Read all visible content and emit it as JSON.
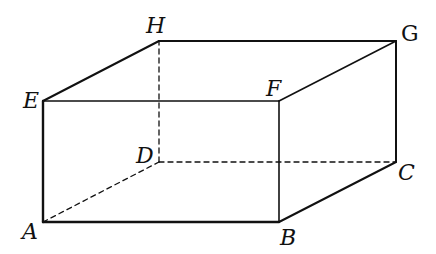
{
  "diagram": {
    "type": "rectangular-prism",
    "colors": {
      "stroke": "#111111",
      "background": "#ffffff"
    },
    "vertices": {
      "A": {
        "x": 43,
        "y": 222,
        "label": "A"
      },
      "B": {
        "x": 279,
        "y": 222,
        "label": "B"
      },
      "C": {
        "x": 396,
        "y": 162,
        "label": "C"
      },
      "D": {
        "x": 159,
        "y": 162,
        "label": "D"
      },
      "E": {
        "x": 43,
        "y": 101,
        "label": "E"
      },
      "F": {
        "x": 279,
        "y": 101,
        "label": "F"
      },
      "G": {
        "x": 396,
        "y": 41,
        "label": "G"
      },
      "H": {
        "x": 159,
        "y": 41,
        "label": "H"
      }
    },
    "solid_edges": [
      "AB",
      "BC",
      "CG",
      "GH",
      "HE",
      "EA",
      "EF",
      "FB",
      "FG"
    ],
    "hidden_edges": [
      "AD",
      "DC",
      "DH"
    ]
  }
}
